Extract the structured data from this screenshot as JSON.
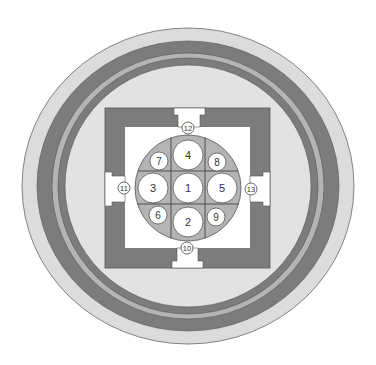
{
  "diagram": {
    "colors": {
      "background": "#ffffff",
      "outer_ring": "#dcdcdc",
      "dark_band": "#7c7c7c",
      "light_band": "#b4b4b4",
      "inner_field": "#e2e2e2",
      "wall": "#7c7c7c",
      "courtyard": "#ffffff",
      "disc": "#b4b4b4",
      "stroke": "#555555"
    },
    "cells": [
      {
        "id": "1",
        "label": "1",
        "cx": 188,
        "cy": 188,
        "r": 15
      },
      {
        "id": "2",
        "label": "2",
        "cx": 188,
        "cy": 222,
        "r": 15
      },
      {
        "id": "3",
        "label": "3",
        "cx": 153,
        "cy": 188,
        "r": 15
      },
      {
        "id": "4",
        "label": "4",
        "cx": 188,
        "cy": 155,
        "r": 15
      },
      {
        "id": "5",
        "label": "5",
        "cx": 222,
        "cy": 188,
        "r": 15
      },
      {
        "id": "6",
        "label": "6",
        "cx": 158,
        "cy": 215,
        "r": 9
      },
      {
        "id": "7",
        "label": "7",
        "cx": 159,
        "cy": 161,
        "r": 9
      },
      {
        "id": "8",
        "label": "8",
        "cx": 217,
        "cy": 162,
        "r": 9
      },
      {
        "id": "9",
        "label": "9",
        "cx": 216,
        "cy": 217,
        "r": 9
      }
    ],
    "gates": [
      {
        "id": "10",
        "label": "10",
        "position": "bottom",
        "lx": 187,
        "ly": 248
      },
      {
        "id": "11",
        "label": "11",
        "position": "left",
        "lx": 124,
        "ly": 188
      },
      {
        "id": "12",
        "label": "12",
        "position": "top",
        "lx": 188,
        "ly": 128
      },
      {
        "id": "13",
        "label": "13",
        "position": "right",
        "lx": 251,
        "ly": 189
      }
    ]
  }
}
